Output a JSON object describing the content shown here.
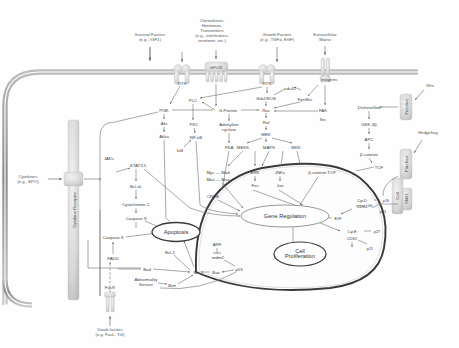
{
  "figure": {
    "title": "",
    "domain": "cell signaling pathway diagram",
    "background_color": "#ffffff",
    "line_color": "#6e6e6e",
    "membrane_color": "#9a9a9a"
  },
  "ligands": [
    {
      "id": "survival-factors",
      "label": "Survival Factors\n(e.g., IGF1)",
      "x": 150,
      "y": 37
    },
    {
      "id": "chemokines",
      "label": "Chemokines,\nHormones,\nTransmitters\n(e.g., interleukins,\nserotonin, etc.)",
      "x": 212,
      "y": 31
    },
    {
      "id": "growth-factors",
      "label": "Growth Factors\n(e.g., TGFα, EGF)",
      "x": 277,
      "y": 37
    },
    {
      "id": "extracellular-matrix",
      "label": "Extracellular\nMatrix",
      "x": 325,
      "y": 37
    },
    {
      "id": "wnt",
      "label": "Wnt",
      "x": 430,
      "y": 85
    },
    {
      "id": "hedgehog",
      "label": "Hedgehog",
      "x": 428,
      "y": 132
    },
    {
      "id": "cytokines",
      "label": "Cytokines\n(e.g., EPO)",
      "x": 28,
      "y": 179
    },
    {
      "id": "death-factors",
      "label": "Death factors\n(e.g. FasL, Tnf)",
      "x": 110,
      "y": 332
    }
  ],
  "receptors": [
    {
      "id": "rtk-left",
      "label": "RTK",
      "x": 182,
      "y": 83
    },
    {
      "id": "gpcr",
      "label": "GPCR",
      "x": 216,
      "y": 79
    },
    {
      "id": "rtk-right",
      "label": "RTK",
      "x": 267,
      "y": 83
    },
    {
      "id": "integrins",
      "label": "Integrins",
      "x": 327,
      "y": 82
    },
    {
      "id": "frizzled",
      "label": "Frizzled",
      "x": 409,
      "y": 107
    },
    {
      "id": "patched",
      "label": "Patched",
      "x": 409,
      "y": 164
    },
    {
      "id": "smo",
      "label": "SMO",
      "x": 409,
      "y": 200
    },
    {
      "id": "cadherins",
      "label": "Cell",
      "x": 397,
      "y": 199
    },
    {
      "id": "cytokine-receptor",
      "label": "Cytokine Receptor",
      "x": 74,
      "y": 190
    },
    {
      "id": "fasr",
      "label": "FasR",
      "x": 110,
      "y": 285
    }
  ],
  "nodes": [
    {
      "id": "plc",
      "label": "PLC",
      "x": 193,
      "y": 100
    },
    {
      "id": "pi3k",
      "label": "PI3K",
      "x": 164,
      "y": 110
    },
    {
      "id": "g-protein",
      "label": "G-Protein",
      "x": 228,
      "y": 110
    },
    {
      "id": "cdc42",
      "label": "cdc42",
      "x": 290,
      "y": 88
    },
    {
      "id": "fyn-shc",
      "label": "FynShc",
      "x": 305,
      "y": 99
    },
    {
      "id": "grb2-sos",
      "label": "Grb2/SOS",
      "x": 266,
      "y": 98
    },
    {
      "id": "ras",
      "label": "Ras",
      "x": 266,
      "y": 110
    },
    {
      "id": "fak",
      "label": "FAK",
      "x": 323,
      "y": 110
    },
    {
      "id": "src",
      "label": "Src",
      "x": 323,
      "y": 119
    },
    {
      "id": "raf",
      "label": "Raf",
      "x": 266,
      "y": 122
    },
    {
      "id": "akt",
      "label": "Akt",
      "x": 164,
      "y": 123
    },
    {
      "id": "pkc",
      "label": "PKC",
      "x": 194,
      "y": 124
    },
    {
      "id": "adenylate-cyclase",
      "label": "Adenylate\ncyclase",
      "x": 229,
      "y": 127
    },
    {
      "id": "akka",
      "label": "Akka",
      "x": 164,
      "y": 136
    },
    {
      "id": "nf-kb",
      "label": "NF-κB",
      "x": 196,
      "y": 137
    },
    {
      "id": "mek",
      "label": "MEK",
      "x": 266,
      "y": 134
    },
    {
      "id": "pka",
      "label": "PKA",
      "x": 229,
      "y": 147
    },
    {
      "id": "ikb",
      "label": "IκB",
      "x": 180,
      "y": 150
    },
    {
      "id": "mekk",
      "label": "MEKK",
      "x": 243,
      "y": 147
    },
    {
      "id": "mapk",
      "label": "MAPK",
      "x": 269,
      "y": 147
    },
    {
      "id": "mkk",
      "label": "MKK",
      "x": 296,
      "y": 147
    },
    {
      "id": "jaks",
      "label": "JAKs",
      "x": 109,
      "y": 158
    },
    {
      "id": "stat35",
      "label": "STAT3,5",
      "x": 138,
      "y": 165
    },
    {
      "id": "bcl-xl",
      "label": "Bcl-xL",
      "x": 136,
      "y": 186
    },
    {
      "id": "cytochrome-c",
      "label": "Cytochrome C",
      "x": 136,
      "y": 204
    },
    {
      "id": "myc-mad",
      "label": "Myc — Mad",
      "x": 218,
      "y": 172
    },
    {
      "id": "max-max",
      "label": "Max — Max",
      "x": 218,
      "y": 179
    },
    {
      "id": "erk",
      "label": "ERK",
      "x": 255,
      "y": 172
    },
    {
      "id": "jnks",
      "label": "JNKs",
      "x": 280,
      "y": 172
    },
    {
      "id": "fos",
      "label": "Fos",
      "x": 255,
      "y": 185
    },
    {
      "id": "jun",
      "label": "Jun",
      "x": 280,
      "y": 185
    },
    {
      "id": "beta-catenin-tcf",
      "label": "β-catenin:TCF",
      "x": 322,
      "y": 172
    },
    {
      "id": "creb",
      "label": "CREB",
      "x": 213,
      "y": 196
    },
    {
      "id": "caspase-9",
      "label": "Caspase 9",
      "x": 136,
      "y": 218
    },
    {
      "id": "caspase-8",
      "label": "Caspase 8",
      "x": 113,
      "y": 237
    },
    {
      "id": "fadd",
      "label": "FADD",
      "x": 113,
      "y": 258
    },
    {
      "id": "bcl-2",
      "label": "Bcl-2",
      "x": 170,
      "y": 252
    },
    {
      "id": "bad",
      "label": "Bad",
      "x": 147,
      "y": 269
    },
    {
      "id": "bim",
      "label": "Bim",
      "x": 172,
      "y": 285
    },
    {
      "id": "abnormality-sensor",
      "label": "Abnormality\nSensor",
      "x": 146,
      "y": 282
    },
    {
      "id": "mt",
      "label": "Mt",
      "x": 196,
      "y": 272
    },
    {
      "id": "bax",
      "label": "Bax",
      "x": 216,
      "y": 272
    },
    {
      "id": "arf",
      "label": "ARF",
      "x": 217,
      "y": 244
    },
    {
      "id": "mdm2",
      "label": "mdm2",
      "x": 218,
      "y": 257
    },
    {
      "id": "p53",
      "label": "p53",
      "x": 239,
      "y": 269
    },
    {
      "id": "cycd",
      "label": "CycD",
      "x": 362,
      "y": 200
    },
    {
      "id": "cdk4",
      "label": "CDK4",
      "x": 362,
      "y": 206
    },
    {
      "id": "p16",
      "label": "p16",
      "x": 386,
      "y": 200
    },
    {
      "id": "p15",
      "label": "p15",
      "x": 383,
      "y": 211
    },
    {
      "id": "e2f",
      "label": "E2F",
      "x": 338,
      "y": 218
    },
    {
      "id": "cyce",
      "label": "CycE",
      "x": 352,
      "y": 231
    },
    {
      "id": "cdk2",
      "label": "CDK2",
      "x": 352,
      "y": 238
    },
    {
      "id": "p27",
      "label": "p27",
      "x": 377,
      "y": 231
    },
    {
      "id": "p21",
      "label": "p21",
      "x": 370,
      "y": 248
    },
    {
      "id": "gli",
      "label": "Gli",
      "x": 370,
      "y": 205
    },
    {
      "id": "dishevelled",
      "label": "Dishevelled",
      "x": 369,
      "y": 107
    },
    {
      "id": "gsk-3b",
      "label": "GSK-3β",
      "x": 369,
      "y": 124
    },
    {
      "id": "apc",
      "label": "APC",
      "x": 369,
      "y": 139
    },
    {
      "id": "beta-catenin",
      "label": "β-catenin",
      "x": 369,
      "y": 154
    },
    {
      "id": "tcf",
      "label": "TCF",
      "x": 379,
      "y": 167
    }
  ],
  "outcomes": [
    {
      "id": "gene-regulation",
      "label": "Gene Regulation",
      "x": 285,
      "y": 216
    },
    {
      "id": "cell-proliferation",
      "label": "Cell\nProliferation",
      "x": 300,
      "y": 254
    },
    {
      "id": "apoptosis",
      "label": "Apoptosis",
      "x": 176,
      "y": 232
    }
  ],
  "legend": {
    "nucleus_label": "",
    "membrane_label": ""
  }
}
